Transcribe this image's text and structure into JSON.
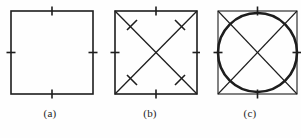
{
  "figure": {
    "background_color": "#fefefe",
    "stroke_color": "#1d1d1d",
    "panel_count": 3,
    "panels": [
      {
        "id": "a",
        "caption": "(a)",
        "shape_name": "square",
        "description": "Square with congruence tick marks at the midpoint of each of the four sides",
        "square": {
          "x": 11,
          "y": 11,
          "width": 82,
          "height": 83,
          "stroke_width": 1.6
        },
        "diagonals": false,
        "circle": false,
        "side_ticks": 4,
        "diagonal_ticks": 0,
        "tick_length": 9,
        "tick_stroke_width": 1.6
      },
      {
        "id": "b",
        "caption": "(b)",
        "shape_name": "square-with-diagonals",
        "description": "Square with both diagonals drawn, tick marks at midpoints of all four sides and a tick mark on each of the four diagonal half-segments",
        "square": {
          "x": 15,
          "y": 11,
          "width": 82,
          "height": 83,
          "stroke_width": 1.6
        },
        "diagonals": true,
        "circle": false,
        "side_ticks": 4,
        "diagonal_ticks": 4,
        "tick_length": 9,
        "tick_stroke_width": 1.6,
        "diagonal_stroke_width": 1.3
      },
      {
        "id": "c",
        "caption": "(c)",
        "shape_name": "square-with-diagonals-and-inscribed-circle",
        "description": "Square with both diagonals drawn and a heavy inscribed circle tangent to all four sides, with tick marks at the side midpoints",
        "square": {
          "x": 18,
          "y": 11,
          "width": 79,
          "height": 83,
          "stroke_width": 1.1
        },
        "diagonals": true,
        "circle": true,
        "circle_geometry": {
          "cx": 57.5,
          "cy": 52.5,
          "r": 39.5,
          "stroke_width": 2.6
        },
        "side_ticks": 4,
        "diagonal_ticks": 0,
        "tick_length": 9,
        "tick_stroke_width": 1.6,
        "diagonal_stroke_width": 1.1
      }
    ]
  }
}
